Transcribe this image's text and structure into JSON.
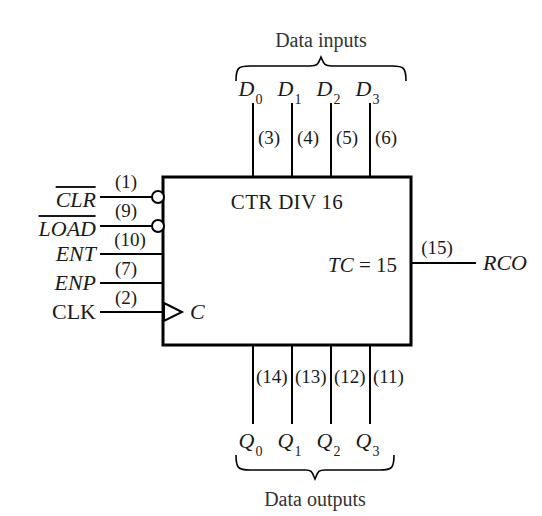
{
  "diagram": {
    "kind": "logic-symbol",
    "device_title": "CTR DIV 16",
    "terminal_count": "TC = 15",
    "terminal_count_italic": "TC",
    "terminal_count_rest": " = 15",
    "clock_label": "C",
    "groups": {
      "inputs_label": "Data inputs",
      "outputs_label": "Data outputs"
    },
    "data_inputs": [
      {
        "name": "D",
        "index": "0",
        "pin": "(3)"
      },
      {
        "name": "D",
        "index": "1",
        "pin": "(4)"
      },
      {
        "name": "D",
        "index": "2",
        "pin": "(5)"
      },
      {
        "name": "D",
        "index": "3",
        "pin": "(6)"
      }
    ],
    "data_outputs": [
      {
        "name": "Q",
        "index": "0",
        "pin": "(14)"
      },
      {
        "name": "Q",
        "index": "1",
        "pin": "(13)"
      },
      {
        "name": "Q",
        "index": "2",
        "pin": "(12)"
      },
      {
        "name": "Q",
        "index": "3",
        "pin": "(11)"
      }
    ],
    "control_inputs": [
      {
        "label": "CLR",
        "pin": "(1)",
        "overbar": true,
        "italic": true,
        "bubble": true
      },
      {
        "label": "LOAD",
        "pin": "(9)",
        "overbar": true,
        "italic": true,
        "bubble": true
      },
      {
        "label": "ENT",
        "pin": "(10)",
        "overbar": false,
        "italic": true,
        "bubble": false
      },
      {
        "label": "ENP",
        "pin": "(7)",
        "overbar": false,
        "italic": true,
        "bubble": false
      },
      {
        "label": "CLK",
        "pin": "(2)",
        "overbar": false,
        "italic": false,
        "bubble": false,
        "clock": true
      }
    ],
    "outputs_right": [
      {
        "label": "RCO",
        "pin": "(15)",
        "italic": true,
        "bubble": false
      }
    ],
    "colors": {
      "ink": "#1a1a1a",
      "line": "#000000",
      "caption": "#333333",
      "background": "#ffffff"
    }
  }
}
